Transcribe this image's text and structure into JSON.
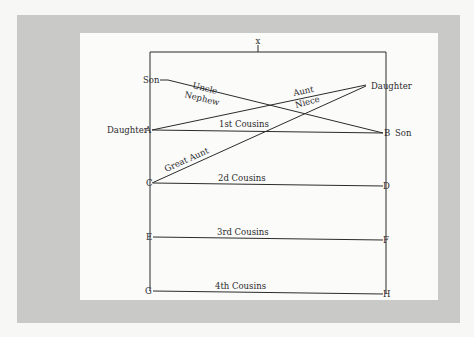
{
  "diagram": {
    "ancestor_label": "x",
    "nodes": {
      "left_son": "Son",
      "right_daughter": "Daughter",
      "A_person": "Daughter",
      "B_person": "Son",
      "A": "A",
      "B": "B",
      "C": "C",
      "D": "D",
      "E": "E",
      "F": "F",
      "G": "G",
      "H": "H"
    },
    "relations": {
      "uncle": "Uncle",
      "nephew": "Nephew",
      "aunt": "Aunt",
      "niece": "Niece",
      "great_aunt": "Great Aunt",
      "first_cousins": "1st Cousins",
      "second_cousins": "2d Cousins",
      "third_cousins": "3rd Cousins",
      "fourth_cousins": "4th Cousins"
    }
  }
}
